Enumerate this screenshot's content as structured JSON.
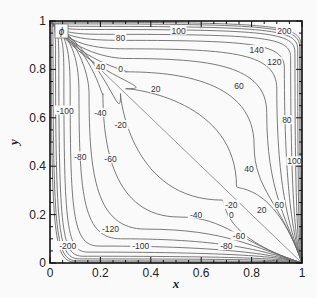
{
  "chart_data": {
    "type": "contour",
    "title": "",
    "variable_label": "ϕ",
    "xlabel": "x",
    "ylabel": "y",
    "xlim": [
      0,
      1
    ],
    "ylim": [
      0,
      1
    ],
    "x_ticks": [
      "0",
      "0.2",
      "0.4",
      "0.6",
      "0.8",
      "1"
    ],
    "y_ticks": [
      "0",
      "0.2",
      "0.4",
      "0.6",
      "0.8",
      "1"
    ],
    "grid": false,
    "levels": [
      -200,
      -180,
      -160,
      -140,
      -120,
      -100,
      -80,
      -60,
      -40,
      -20,
      0,
      20,
      40,
      60,
      80,
      100,
      120,
      140,
      160,
      180,
      200
    ],
    "contour_labels": [
      {
        "text": "0",
        "x": 0.28,
        "y": 0.8
      },
      {
        "text": "0",
        "x": 0.72,
        "y": 0.2
      },
      {
        "text": "20",
        "x": 0.42,
        "y": 0.72
      },
      {
        "text": "-20",
        "x": 0.28,
        "y": 0.57
      },
      {
        "text": "20",
        "x": 0.84,
        "y": 0.22
      },
      {
        "text": "-20",
        "x": 0.72,
        "y": 0.24
      },
      {
        "text": "40",
        "x": 0.2,
        "y": 0.81
      },
      {
        "text": "-40",
        "x": 0.2,
        "y": 0.62
      },
      {
        "text": "40",
        "x": 0.79,
        "y": 0.39
      },
      {
        "text": "-40",
        "x": 0.58,
        "y": 0.2
      },
      {
        "text": "60",
        "x": 0.75,
        "y": 0.73
      },
      {
        "text": "-60",
        "x": 0.24,
        "y": 0.43
      },
      {
        "text": "60",
        "x": 0.91,
        "y": 0.24
      },
      {
        "text": "-60",
        "x": 0.75,
        "y": 0.11
      },
      {
        "text": "80",
        "x": 0.28,
        "y": 0.93
      },
      {
        "text": "-80",
        "x": 0.12,
        "y": 0.44
      },
      {
        "text": "80",
        "x": 0.94,
        "y": 0.59
      },
      {
        "text": "-80",
        "x": 0.7,
        "y": 0.07
      },
      {
        "text": "100",
        "x": 0.51,
        "y": 0.96
      },
      {
        "text": "-100",
        "x": 0.06,
        "y": 0.63
      },
      {
        "text": "100",
        "x": 0.97,
        "y": 0.42
      },
      {
        "text": "-100",
        "x": 0.36,
        "y": 0.07
      },
      {
        "text": "120",
        "x": 0.89,
        "y": 0.83
      },
      {
        "text": "-120",
        "x": 0.24,
        "y": 0.14
      },
      {
        "text": "140",
        "x": 0.82,
        "y": 0.88
      },
      {
        "text": "200",
        "x": 0.93,
        "y": 0.96
      },
      {
        "text": "-200",
        "x": 0.07,
        "y": 0.07
      }
    ]
  },
  "legend": {
    "symbol": "ϕ"
  },
  "axes": {
    "x_title": "x",
    "y_title": "y",
    "x_ticks": [
      "0",
      "0.2",
      "0.4",
      "0.6",
      "0.8",
      "1"
    ],
    "y_ticks": [
      "0",
      "0.2",
      "0.4",
      "0.6",
      "0.8",
      "1"
    ]
  }
}
